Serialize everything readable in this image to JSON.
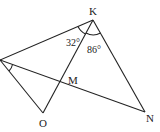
{
  "diagram": {
    "type": "geometry",
    "points": {
      "K": {
        "label": "K",
        "x": 93,
        "y": 20
      },
      "P": {
        "label": "",
        "x": 0,
        "y": 60
      },
      "O": {
        "label": "O",
        "x": 43,
        "y": 113
      },
      "N": {
        "label": "N",
        "x": 145,
        "y": 112
      },
      "M": {
        "label": "M",
        "x": 61,
        "y": 83
      }
    },
    "segments": [
      [
        "P",
        "K"
      ],
      [
        "K",
        "O"
      ],
      [
        "K",
        "N"
      ],
      [
        "P",
        "O"
      ],
      [
        "P",
        "N"
      ]
    ],
    "angles": {
      "a1": {
        "label": "32°",
        "vertex": "K"
      },
      "a2": {
        "label": "86°",
        "vertex": "K"
      },
      "a3": {
        "label": "",
        "vertex": "P"
      }
    },
    "stroke_color": "#222222"
  }
}
